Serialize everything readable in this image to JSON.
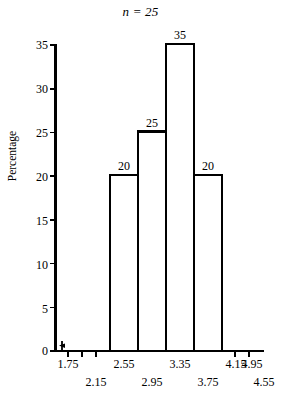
{
  "chart_data": {
    "type": "bar",
    "title": "n = 25",
    "xlabel": "",
    "ylabel": "Percentage",
    "ylim": [
      0,
      35
    ],
    "grid": false,
    "legend": null,
    "bin_width": 0.4,
    "bin_edges": [
      2.55,
      2.95,
      3.35,
      3.75,
      4.15
    ],
    "categories": [
      "2.55–2.95",
      "2.95–3.35",
      "3.35–3.75",
      "3.75–4.15"
    ],
    "values": [
      20,
      25,
      35,
      20
    ],
    "bar_labels": [
      "20",
      "25",
      "35",
      "20"
    ],
    "x_axis": {
      "ticks": [
        1.75,
        2.15,
        2.55,
        2.95,
        3.35,
        3.75,
        4.15,
        4.55,
        4.95
      ],
      "tick_labels": [
        "1.75",
        "2.15",
        "2.55",
        "2.95",
        "3.35",
        "3.75",
        "4.15",
        "4.55",
        "4.95"
      ],
      "staggered": true,
      "upper_row": [
        "1.75",
        "2.55",
        "3.35",
        "4.15",
        "4.95"
      ],
      "lower_row": [
        "2.15",
        "2.95",
        "3.75",
        "4.55"
      ],
      "has_axis_break": true
    },
    "y_axis": {
      "ticks": [
        0,
        5,
        10,
        15,
        20,
        25,
        30,
        35
      ],
      "tick_labels": [
        "0",
        "5",
        "10",
        "15",
        "20",
        "25",
        "30",
        "35"
      ]
    },
    "colors": {
      "axis": "#000000",
      "bar_outline": "#000000",
      "bar_fill": "#ffffff",
      "background": "#ffffff",
      "text": "#000000"
    }
  }
}
